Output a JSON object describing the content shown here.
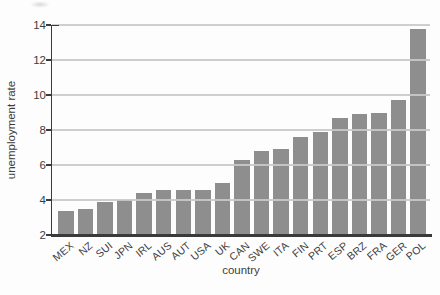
{
  "chart_data": {
    "type": "bar",
    "title": "",
    "xlabel": "country",
    "ylabel": "unemployment rate",
    "categories": [
      "MEX",
      "NZ",
      "SUI",
      "JPN",
      "IRL",
      "AUS",
      "AUT",
      "USA",
      "UK",
      "CAN",
      "SWE",
      "ITA",
      "FIN",
      "PRT",
      "ESP",
      "BRZ",
      "FRA",
      "GER",
      "POL"
    ],
    "values": [
      3.4,
      3.5,
      3.9,
      4.0,
      4.4,
      4.6,
      4.6,
      4.6,
      5.0,
      6.3,
      6.8,
      6.9,
      7.6,
      7.9,
      8.7,
      8.9,
      9.0,
      9.7,
      13.8
    ],
    "ylim": [
      2,
      14
    ],
    "yticks": [
      2,
      4,
      6,
      8,
      10,
      12,
      14
    ],
    "grid": "horizontal",
    "legend": "none",
    "colors": {
      "bar": "#8e8e8e",
      "axis": "#3a3a3a",
      "gridline": "#c9c9c9",
      "text": "#3d3d3d",
      "background": "#fdfdfd"
    }
  }
}
